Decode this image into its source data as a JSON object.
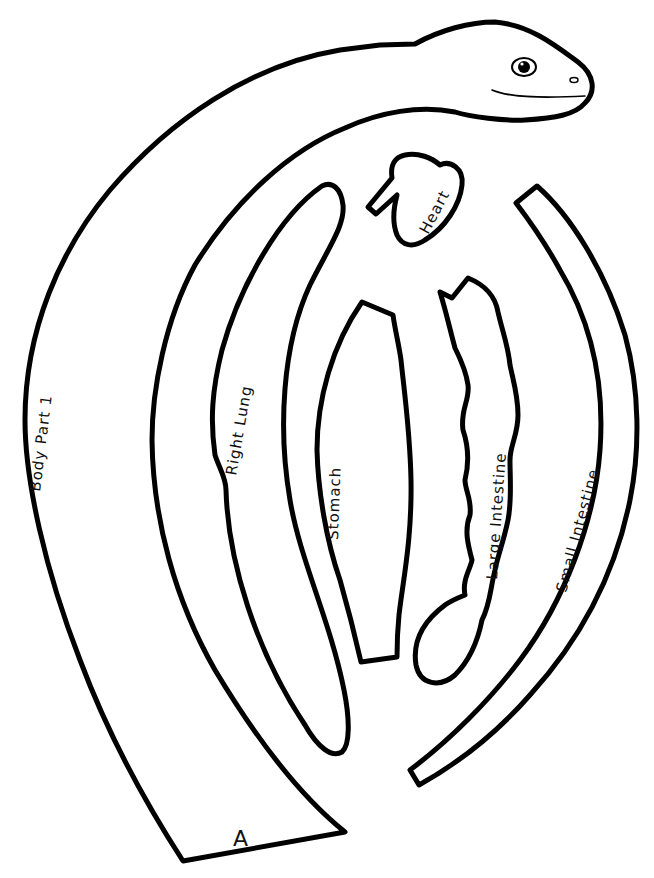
{
  "worksheet": {
    "kind": "cut-out template",
    "colors": {
      "line": "#000000",
      "background": "#ffffff"
    },
    "pieces": [
      {
        "id": "body",
        "label": "Body Part 1",
        "tab_label": "A"
      },
      {
        "id": "heart",
        "label": "Heart"
      },
      {
        "id": "right-lung",
        "label": "Right Lung"
      },
      {
        "id": "stomach",
        "label": "Stomach"
      },
      {
        "id": "large-intestine",
        "label": "Large Intestine"
      },
      {
        "id": "small-intestine",
        "label": "Small Intestine"
      }
    ]
  }
}
